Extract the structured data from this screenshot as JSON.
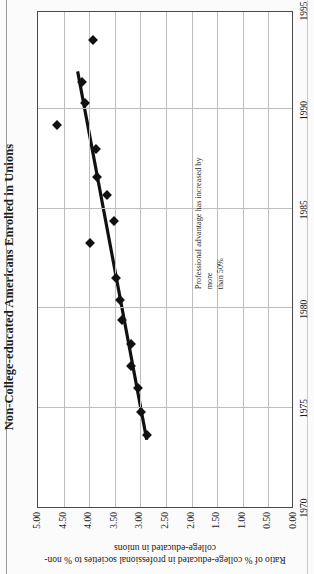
{
  "chart_data": {
    "type": "scatter",
    "title": "Non-College-educated Americans Enrolled in Unions",
    "xlabel": "",
    "ylabel": "Ratio of % college-educated in professional societies to % non-college-educated in unions",
    "xlim": [
      1970,
      1995
    ],
    "ylim": [
      0.0,
      5.0
    ],
    "xticks": [
      "1970",
      "1975",
      "1980",
      "1985",
      "1990",
      "1995"
    ],
    "yticks": [
      "0.00",
      "0.50",
      "1.00",
      "1.50",
      "2.00",
      "2.50",
      "3.00",
      "3.50",
      "4.00",
      "4.50",
      "5.00"
    ],
    "grid": "vertical",
    "legend": "none",
    "x": [
      1973.6,
      1974.8,
      1976.0,
      1977.1,
      1978.2,
      1979.4,
      1980.4,
      1981.5,
      1983.3,
      1984.4,
      1985.7,
      1986.6,
      1988.0,
      1989.2,
      1990.3,
      1991.4,
      1993.5
    ],
    "values": [
      2.88,
      2.98,
      3.04,
      3.18,
      3.18,
      3.36,
      3.4,
      3.48,
      3.98,
      3.52,
      3.66,
      3.84,
      3.86,
      4.62,
      4.08,
      4.14,
      3.92
    ],
    "points": [
      {
        "x": 1973.6,
        "y": 2.88
      },
      {
        "x": 1974.8,
        "y": 2.98
      },
      {
        "x": 1976.0,
        "y": 3.04
      },
      {
        "x": 1977.1,
        "y": 3.18
      },
      {
        "x": 1978.2,
        "y": 3.18
      },
      {
        "x": 1979.4,
        "y": 3.36
      },
      {
        "x": 1980.4,
        "y": 3.4
      },
      {
        "x": 1981.5,
        "y": 3.48
      },
      {
        "x": 1983.3,
        "y": 3.98
      },
      {
        "x": 1984.4,
        "y": 3.52
      },
      {
        "x": 1985.7,
        "y": 3.66
      },
      {
        "x": 1986.6,
        "y": 3.84
      },
      {
        "x": 1988.0,
        "y": 3.86
      },
      {
        "x": 1989.2,
        "y": 4.62
      },
      {
        "x": 1990.3,
        "y": 4.08
      },
      {
        "x": 1991.4,
        "y": 4.14
      },
      {
        "x": 1993.5,
        "y": 3.92
      }
    ],
    "trendline": {
      "x0": 1973.4,
      "y0": 2.86,
      "x1": 1992.0,
      "y1": 4.22,
      "color": "#111111"
    },
    "annotation": {
      "line1": "Professional advantage has increased by more",
      "line2": "than 50%"
    }
  }
}
